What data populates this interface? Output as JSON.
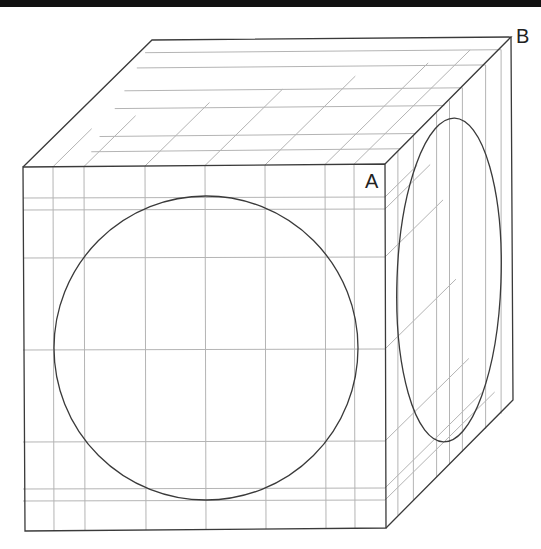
{
  "diagram": {
    "labels": [
      {
        "id": "A",
        "text": "A",
        "x": 365,
        "y": 188
      },
      {
        "id": "B",
        "text": "B",
        "x": 516,
        "y": 43
      }
    ],
    "colors": {
      "edge": "#3a3a3a",
      "grid": "#b4b4b4",
      "background": "#ffffff",
      "topbar": "#111111"
    },
    "cube": {
      "front": {
        "tl": [
          23,
          167
        ],
        "tr": [
          385,
          164
        ],
        "br": [
          386,
          528
        ],
        "bl": [
          25,
          531
        ]
      },
      "back": {
        "tl": [
          152,
          40
        ],
        "tr": [
          511,
          37
        ],
        "br": [
          513,
          400
        ]
      }
    },
    "front_circle": {
      "cx": 206,
      "cy": 348,
      "r": 152
    },
    "right_ellipse": {
      "cx": 449,
      "cy": 280,
      "rx": 52,
      "ry": 162,
      "rotate": 2
    },
    "grid": {
      "front_verticals_x": [
        53,
        84,
        145,
        205,
        265,
        325,
        354
      ],
      "front_horizontals_y": [
        197,
        209,
        257,
        349,
        441,
        488,
        500
      ],
      "top_depth_fractions": [
        0.12,
        0.24,
        0.46,
        0.6,
        0.78,
        0.9
      ],
      "right_depth_fractions": [
        0.1,
        0.22,
        0.4,
        0.5,
        0.6,
        0.78,
        0.9
      ]
    }
  }
}
